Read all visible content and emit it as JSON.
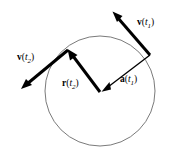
{
  "figure": {
    "background_color": "#ffffff",
    "width": 175,
    "height": 154
  },
  "circle": {
    "name": "trajectory-circle",
    "center_x": 100,
    "center_y": 91,
    "radius": 55,
    "stroke_color": "#6b6b6b",
    "stroke_width": 0.9,
    "fill": "none"
  },
  "vectors": [
    {
      "id": "v-t1",
      "symbol": "v",
      "argument": "t",
      "subscript": "1",
      "label": "v(t1)",
      "kind": "velocity",
      "stroke_color": "#000000",
      "stroke_width": 3.0,
      "x1": 150,
      "y1": 55,
      "x2": 114,
      "y2": 13,
      "label_x": 137,
      "label_y": 25
    },
    {
      "id": "v-t2",
      "symbol": "v",
      "argument": "t",
      "subscript": "2",
      "label": "v(t2)",
      "kind": "velocity",
      "stroke_color": "#000000",
      "stroke_width": 3.0,
      "x1": 68,
      "y1": 50,
      "x2": 22,
      "y2": 88,
      "label_x": 17,
      "label_y": 60
    },
    {
      "id": "r-t2",
      "symbol": "r",
      "argument": "t",
      "subscript": "2",
      "label": "r(t2)",
      "kind": "position",
      "stroke_color": "#000000",
      "stroke_width": 3.0,
      "x1": 100,
      "y1": 92,
      "x2": 68,
      "y2": 50,
      "label_x": 62,
      "label_y": 86
    },
    {
      "id": "a-t1",
      "symbol": "a",
      "argument": "t",
      "subscript": "1",
      "label": "a(t1)",
      "kind": "acceleration",
      "stroke_color": "#000000",
      "stroke_width": 1.4,
      "x1": 150,
      "y1": 55,
      "x2": 102,
      "y2": 91,
      "label_x": 120,
      "label_y": 82
    }
  ],
  "glyphs": {
    "paren_open": "(",
    "paren_close": ")"
  }
}
